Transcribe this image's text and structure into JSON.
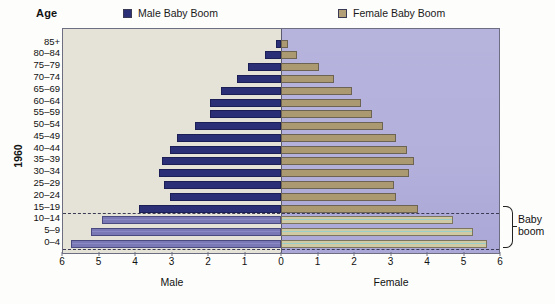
{
  "header": {
    "age_title": "Age",
    "year_label": "1960"
  },
  "legend": [
    {
      "label": "Male Baby Boom",
      "color": "#2b2f76",
      "icon": "square-swatch-icon"
    },
    {
      "label": "Female Baby Boom",
      "color": "#b3a078",
      "icon": "square-swatch-icon"
    }
  ],
  "annotation": {
    "brace_label_line1": "Baby",
    "brace_label_line2": "boom"
  },
  "axis": {
    "left_caption": "Male",
    "right_caption": "Female",
    "tick_labels_left": [
      "6",
      "5",
      "4",
      "3",
      "2",
      "1"
    ],
    "tick_labels_center": "0",
    "tick_labels_right": [
      "1",
      "2",
      "3",
      "4",
      "5",
      "6"
    ]
  },
  "chart_data": {
    "type": "bar",
    "subtype": "population-pyramid",
    "title": "",
    "xlabel": "Percent of total population",
    "ylabel": "Age",
    "year": "1960",
    "xlim": [
      -6,
      6
    ],
    "grid": false,
    "legend_position": "top",
    "categories": [
      "85+",
      "80–84",
      "75–79",
      "70–74",
      "65–69",
      "60–64",
      "55–59",
      "50–54",
      "45–49",
      "40–44",
      "35–39",
      "30–34",
      "25–29",
      "20–24",
      "15–19",
      "10–14",
      "5–9",
      "0–4"
    ],
    "baby_boom_categories": [
      "10–14",
      "5–9",
      "0–4"
    ],
    "series": [
      {
        "name": "Male",
        "direction": "left",
        "color": "#2b2f76",
        "boom_color": "#7a79b6",
        "values": [
          0.15,
          0.45,
          0.9,
          1.2,
          1.65,
          1.95,
          1.95,
          2.35,
          2.85,
          3.05,
          3.25,
          3.35,
          3.2,
          3.05,
          3.9,
          4.9,
          5.2,
          5.75
        ]
      },
      {
        "name": "Female",
        "direction": "right",
        "color": "#ab9a71",
        "boom_color": "#cfc9a4",
        "values": [
          0.2,
          0.45,
          1.05,
          1.45,
          1.95,
          2.2,
          2.5,
          2.8,
          3.15,
          3.45,
          3.65,
          3.5,
          3.1,
          3.15,
          3.75,
          4.7,
          5.25,
          5.65
        ]
      }
    ]
  }
}
